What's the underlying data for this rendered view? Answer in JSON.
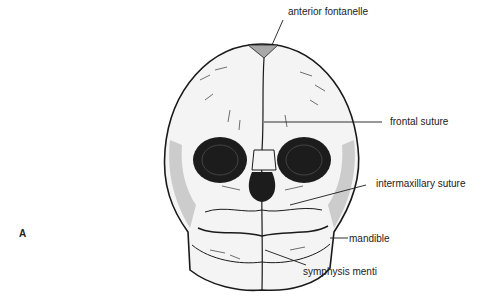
{
  "figure": {
    "panel_letter": "A",
    "labels": [
      {
        "id": "anterior-fontanelle",
        "text": "anterior fontanelle"
      },
      {
        "id": "frontal-suture",
        "text": "frontal suture"
      },
      {
        "id": "intermaxillary-suture",
        "text": "intermaxillary suture"
      },
      {
        "id": "mandible",
        "text": "mandible"
      },
      {
        "id": "symphysis-menti",
        "text": "symphysis menti"
      }
    ],
    "colors": {
      "line": "#1a1a1a",
      "bone": "#f4f4f4",
      "fontanelle": "#a8a8a8",
      "orbit": "#1c1c1c"
    }
  }
}
